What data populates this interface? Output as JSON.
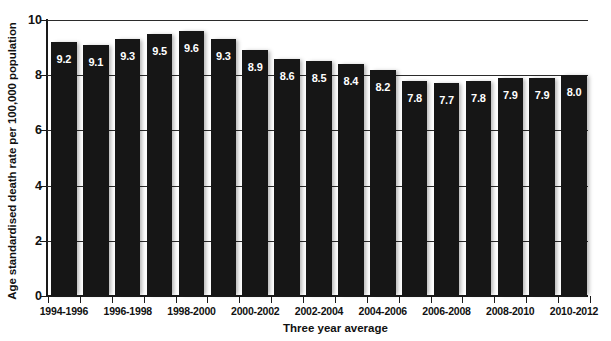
{
  "chart_data": {
    "type": "bar",
    "title": "",
    "xlabel": "Three year average",
    "ylabel": "Age standardised death rate per 100,000 population",
    "ylim": [
      0,
      10
    ],
    "ytick_labels": [
      "10",
      "8",
      "6",
      "4",
      "2",
      "0"
    ],
    "ytick_values": [
      10,
      8,
      6,
      4,
      2,
      0
    ],
    "grid": true,
    "grid_axis": "y",
    "legend": "none",
    "categories": [
      "1994-1996",
      "1995-1997",
      "1996-1998",
      "1997-1999",
      "1998-2000",
      "1999-2001",
      "2000-2002",
      "2001-2003",
      "2002-2004",
      "2003-2005",
      "2004-2006",
      "2005-2007",
      "2006-2008",
      "2007-2009",
      "2008-2010",
      "2009-2011",
      "2010-2012"
    ],
    "values": [
      9.2,
      9.1,
      9.3,
      9.5,
      9.6,
      9.3,
      8.9,
      8.6,
      8.5,
      8.4,
      8.2,
      7.8,
      7.7,
      7.8,
      7.9,
      7.9,
      8.0
    ],
    "data_labels": [
      "9.2",
      "9.1",
      "9.3",
      "9.5",
      "9.6",
      "9.3",
      "8.9",
      "8.6",
      "8.5",
      "8.4",
      "8.2",
      "7.8",
      "7.7",
      "7.8",
      "7.9",
      "7.9",
      "8.0"
    ],
    "visible_xtick_labels": [
      "1994-1996",
      "1996-1998",
      "1998-2000",
      "2000-2002",
      "2002-2004",
      "2004-2006",
      "2006-2008",
      "2008-2010",
      "2010-2012"
    ],
    "visible_xtick_label_indices": [
      0,
      2,
      4,
      6,
      8,
      10,
      12,
      14,
      16
    ],
    "bar_color": "#161616",
    "data_label_color": "#ffffff",
    "axis_color": "#1a1a1a",
    "grid_color": "#2b2b2b",
    "background_color": "#ffffff"
  }
}
